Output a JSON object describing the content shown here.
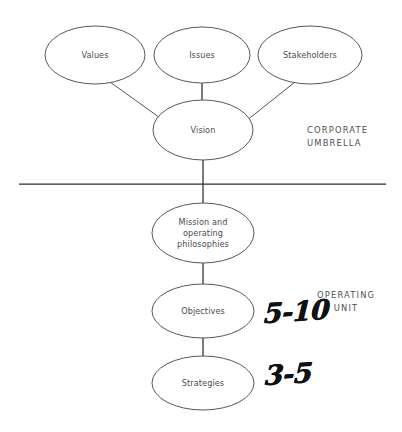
{
  "diagram": {
    "colors": {
      "background": "#ffffff",
      "node_stroke": "#58585a",
      "node_fill": "#ffffff",
      "connector": "#3b3b3d",
      "divider": "#2e2e30",
      "label_text": "#4a4a4e",
      "zone_text": "#4f4f53",
      "handwriting": "#111113"
    },
    "nodes": [
      {
        "id": "values",
        "label": "Values",
        "cx": 95,
        "cy": 55,
        "rx": 50,
        "ry": 29
      },
      {
        "id": "issues",
        "label": "Issues",
        "cx": 202,
        "cy": 55,
        "rx": 48,
        "ry": 28
      },
      {
        "id": "stakeholders",
        "label": "Stakeholders",
        "cx": 310,
        "cy": 55,
        "rx": 52,
        "ry": 29
      },
      {
        "id": "vision",
        "label": "Vision",
        "cx": 203,
        "cy": 130,
        "rx": 50,
        "ry": 30
      },
      {
        "id": "mission",
        "label": "Mission and operating philosophies",
        "cx": 203,
        "cy": 233,
        "rx": 51,
        "ry": 30
      },
      {
        "id": "objectives",
        "label": "Objectives",
        "cx": 203,
        "cy": 311,
        "rx": 51,
        "ry": 27
      },
      {
        "id": "strategies",
        "label": "Strategies",
        "cx": 203,
        "cy": 383,
        "rx": 51,
        "ry": 27
      }
    ],
    "node_label_lines": {
      "values": [
        "Values"
      ],
      "issues": [
        "Issues"
      ],
      "stakeholders": [
        "Stakeholders"
      ],
      "vision": [
        "Vision"
      ],
      "mission": [
        "Mission and",
        "operating",
        "philosophies"
      ],
      "objectives": [
        "Objectives"
      ],
      "strategies": [
        "Strategies"
      ]
    },
    "edges": [
      {
        "id": "values-to-vision",
        "from": "values",
        "to": "vision",
        "x1": 110,
        "y1": 82,
        "x2": 163,
        "y2": 120
      },
      {
        "id": "issues-to-vision",
        "from": "issues",
        "to": "vision",
        "x1": 202,
        "y1": 83,
        "x2": 202,
        "y2": 101
      },
      {
        "id": "stakeholders-to-vision",
        "from": "stakeholders",
        "to": "vision",
        "x1": 295,
        "y1": 82,
        "x2": 246,
        "y2": 121
      },
      {
        "id": "vision-to-mission",
        "from": "vision",
        "to": "mission",
        "x1": 203,
        "y1": 160,
        "x2": 203,
        "y2": 203
      },
      {
        "id": "mission-to-objectives",
        "from": "mission",
        "to": "objectives",
        "x1": 203,
        "y1": 263,
        "x2": 203,
        "y2": 284
      },
      {
        "id": "objectives-to-strategies",
        "from": "objectives",
        "to": "strategies",
        "x1": 203,
        "y1": 338,
        "x2": 203,
        "y2": 356
      }
    ],
    "divider": {
      "id": "corporate-operating-divider",
      "x1": 19,
      "y1": 184,
      "x2": 386,
      "y2": 184
    },
    "zones": [
      {
        "id": "corporate-umbrella",
        "text": "CORPORATE\nUMBRELLA"
      },
      {
        "id": "operating-unit",
        "text": "OPERATING\nUNIT"
      }
    ],
    "annotations": [
      {
        "id": "objectives-range",
        "text": "5-10",
        "relates_to": "objectives"
      },
      {
        "id": "strategies-range",
        "text": "3-5",
        "relates_to": "strategies"
      }
    ]
  }
}
